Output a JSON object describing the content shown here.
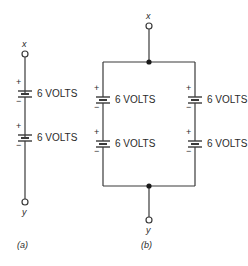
{
  "diagram": {
    "colors": {
      "line": "#3a3a3a",
      "text": "#2a2a2a",
      "background": "#ffffff"
    },
    "a": {
      "caption": "(a)",
      "top_terminal": "x",
      "bottom_terminal": "y",
      "batteries": [
        {
          "label": "6 VOLTS",
          "plus": "+",
          "minus": "−"
        },
        {
          "label": "6 VOLTS",
          "plus": "+",
          "minus": "−"
        }
      ]
    },
    "b": {
      "caption": "(b)",
      "top_terminal": "x",
      "bottom_terminal": "y",
      "left_branch": [
        {
          "label": "6 VOLTS",
          "plus": "+",
          "minus": "−"
        },
        {
          "label": "6 VOLTS",
          "plus": "+",
          "minus": "−"
        }
      ],
      "right_branch": [
        {
          "label": "6 VOLTS",
          "plus": "+",
          "minus": "−"
        },
        {
          "label": "6 VOLTS",
          "plus": "+",
          "minus": "−"
        }
      ]
    }
  }
}
